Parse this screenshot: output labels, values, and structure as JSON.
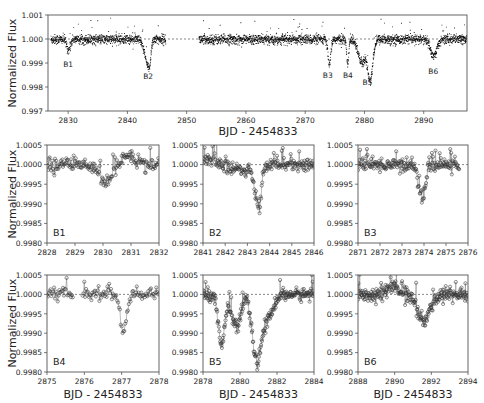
{
  "figure": {
    "xlabel": "BJD - 2454833",
    "ylabel": "Normalized Flux"
  },
  "chart_data": [
    {
      "id": "overview",
      "type": "scatter",
      "title": "",
      "xlabel": "BJD - 2454833",
      "ylabel": "Normalized Flux",
      "xlim": [
        2826.6,
        2897.3
      ],
      "ylim": [
        0.997,
        1.001
      ],
      "xticks": [
        2830,
        2840,
        2850,
        2860,
        2870,
        2880,
        2890
      ],
      "yticks": [
        0.997,
        0.998,
        0.999,
        1.0,
        1.001
      ],
      "ytick_labels": [
        "0.997",
        "0.998",
        "0.999",
        "1.000",
        "1.001"
      ],
      "reference_line": 1.0,
      "data_segments": [
        [
          2827.0,
          2846.4
        ],
        [
          2852.0,
          2897.3
        ]
      ],
      "noise": 0.0001,
      "dips": [
        {
          "center": 2830.0,
          "depth": 0.00045,
          "width": 0.6
        },
        {
          "center": 2843.6,
          "depth": 0.0012,
          "width": 1.4,
          "asym": true
        },
        {
          "center": 2874.0,
          "depth": 0.0011,
          "width": 0.5
        },
        {
          "center": 2877.1,
          "depth": 0.0011,
          "width": 0.35
        },
        {
          "center": 2879.5,
          "depth": 0.001,
          "width": 1.2
        },
        {
          "center": 2880.9,
          "depth": 0.0017,
          "width": 0.9
        },
        {
          "center": 2891.6,
          "depth": 0.0007,
          "width": 1.1
        }
      ],
      "annotations": [
        {
          "label": "B1",
          "x": 2830.0,
          "y": 0.99883
        },
        {
          "label": "B2",
          "x": 2843.5,
          "y": 0.99835
        },
        {
          "label": "B3",
          "x": 2873.8,
          "y": 0.99838
        },
        {
          "label": "B4",
          "x": 2877.2,
          "y": 0.99838
        },
        {
          "label": "B5",
          "x": 2880.5,
          "y": 0.99808
        },
        {
          "label": "B6",
          "x": 2891.6,
          "y": 0.99855
        }
      ],
      "grid": false
    },
    {
      "id": "B1",
      "type": "scatter",
      "label": "B1",
      "xlim": [
        2828,
        2832
      ],
      "ylim": [
        0.998,
        1.0005
      ],
      "xticks": [
        2828,
        2829,
        2830,
        2831,
        2832
      ],
      "yticks": [
        0.998,
        0.9985,
        0.999,
        0.9995,
        1.0,
        1.0005
      ],
      "ytick_labels": [
        "0.9980",
        "0.9985",
        "0.9990",
        "0.9995",
        "1.0000",
        "1.0005"
      ],
      "show_ylabel": true,
      "show_xlabel": false,
      "reference_line": 1.0,
      "noise": 9e-05,
      "dips": [
        {
          "center": 2830.1,
          "depth": 0.00045,
          "width": 0.45
        },
        {
          "center": 2830.9,
          "depth": -0.00025,
          "width": 0.4
        }
      ]
    },
    {
      "id": "B2",
      "type": "scatter",
      "label": "B2",
      "xlim": [
        2841,
        2846
      ],
      "ylim": [
        0.998,
        1.0005
      ],
      "xticks": [
        2841,
        2842,
        2843,
        2844,
        2845,
        2846
      ],
      "yticks": [
        0.998,
        0.9985,
        0.999,
        0.9995,
        1.0,
        1.0005
      ],
      "ytick_labels": [
        "0.9980",
        "0.9985",
        "0.9990",
        "0.9995",
        "1.0000",
        "1.0005"
      ],
      "show_ylabel": false,
      "show_xlabel": false,
      "reference_line": 1.0,
      "noise": 8e-05,
      "trend": {
        "from": 2841.0,
        "to": 2843.0,
        "start": 0.00015,
        "end": -0.0002
      },
      "dips": [
        {
          "center": 2843.55,
          "depth": 0.0011,
          "width": 0.45,
          "asym": true
        }
      ]
    },
    {
      "id": "B3",
      "type": "scatter",
      "label": "B3",
      "xlim": [
        2871,
        2876
      ],
      "ylim": [
        0.998,
        1.0005
      ],
      "xticks": [
        2871,
        2872,
        2873,
        2874,
        2875,
        2876
      ],
      "yticks": [
        0.998,
        0.9985,
        0.999,
        0.9995,
        1.0,
        1.0005
      ],
      "ytick_labels": [
        "0.9980",
        "0.9985",
        "0.9990",
        "0.9995",
        "1.0000",
        "1.0005"
      ],
      "show_ylabel": false,
      "show_xlabel": false,
      "reference_line": 1.0,
      "noise": 9e-05,
      "data_end": 2875.6,
      "dips": [
        {
          "center": 2873.9,
          "depth": 0.0009,
          "width": 0.3
        }
      ]
    },
    {
      "id": "B4",
      "type": "scatter",
      "label": "B4",
      "xlim": [
        2875,
        2878
      ],
      "ylim": [
        0.998,
        1.0005
      ],
      "xticks": [
        2875,
        2876,
        2877,
        2878
      ],
      "yticks": [
        0.998,
        0.9985,
        0.999,
        0.9995,
        1.0,
        1.0005
      ],
      "ytick_labels": [
        "0.9980",
        "0.9985",
        "0.9990",
        "0.9995",
        "1.0000",
        "1.0005"
      ],
      "show_ylabel": true,
      "show_xlabel": true,
      "reference_line": 1.0,
      "noise": 9e-05,
      "gap": [
        2875.7,
        2875.95
      ],
      "dips": [
        {
          "center": 2877.05,
          "depth": 0.001,
          "width": 0.18
        }
      ]
    },
    {
      "id": "B5",
      "type": "scatter",
      "label": "B5",
      "xlim": [
        2878,
        2884
      ],
      "ylim": [
        0.998,
        1.0005
      ],
      "xticks": [
        2878,
        2880,
        2882,
        2884
      ],
      "yticks": [
        0.998,
        0.9985,
        0.999,
        0.9995,
        1.0,
        1.0005
      ],
      "ytick_labels": [
        "0.9980",
        "0.9985",
        "0.9990",
        "0.9995",
        "1.0000",
        "1.0005"
      ],
      "show_ylabel": false,
      "show_xlabel": true,
      "reference_line": 1.0,
      "noise": 8e-05,
      "dips": [
        {
          "center": 2879.0,
          "depth": 0.0013,
          "width": 0.35
        },
        {
          "center": 2879.8,
          "depth": 0.0009,
          "width": 0.5
        },
        {
          "center": 2880.9,
          "depth": 0.0017,
          "width": 0.5
        },
        {
          "center": 2881.5,
          "depth": 0.0006,
          "width": 0.6
        }
      ]
    },
    {
      "id": "B6",
      "type": "scatter",
      "label": "B6",
      "xlim": [
        2888,
        2894
      ],
      "ylim": [
        0.998,
        1.0005
      ],
      "xticks": [
        2888,
        2890,
        2892,
        2894
      ],
      "yticks": [
        0.998,
        0.9985,
        0.999,
        0.9995,
        1.0,
        1.0005
      ],
      "ytick_labels": [
        "0.9980",
        "0.9985",
        "0.9990",
        "0.9995",
        "1.0000",
        "1.0005"
      ],
      "show_ylabel": false,
      "show_xlabel": true,
      "reference_line": 1.0,
      "noise": 9e-05,
      "dips": [
        {
          "center": 2889.9,
          "depth": -0.00025,
          "width": 0.5
        },
        {
          "center": 2891.6,
          "depth": 0.0007,
          "width": 0.7
        }
      ]
    }
  ],
  "panels_layout": {
    "overview": {
      "x": 48,
      "y": 15,
      "w": 419,
      "h": 96
    },
    "B1": {
      "x": 47,
      "y": 145,
      "w": 112,
      "h": 98
    },
    "B2": {
      "x": 203,
      "y": 145,
      "w": 111,
      "h": 98
    },
    "B3": {
      "x": 358,
      "y": 145,
      "w": 110,
      "h": 98
    },
    "B4": {
      "x": 47,
      "y": 275,
      "w": 112,
      "h": 97
    },
    "B5": {
      "x": 203,
      "y": 275,
      "w": 111,
      "h": 97
    },
    "B6": {
      "x": 358,
      "y": 275,
      "w": 110,
      "h": 97
    }
  }
}
